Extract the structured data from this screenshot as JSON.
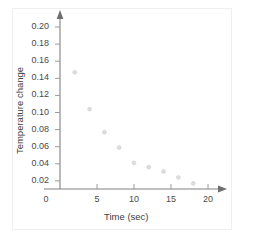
{
  "chart_data": {
    "type": "scatter",
    "title": "",
    "xlabel": "Time (sec)",
    "ylabel": "Temperature change",
    "xlim": [
      0,
      22
    ],
    "ylim": [
      0,
      0.215
    ],
    "grid": false,
    "legend": null,
    "xticks": [
      "0",
      "5",
      "10",
      "15",
      "20"
    ],
    "xtick_values": [
      0,
      5,
      10,
      15,
      20
    ],
    "yticks": [
      "0.02",
      "0.04",
      "0.06",
      "0.08",
      "0.10",
      "0.12",
      "0.14",
      "0.16",
      "0.18",
      "0.20"
    ],
    "ytick_values": [
      0.02,
      0.04,
      0.06,
      0.08,
      0.1,
      0.12,
      0.14,
      0.16,
      0.18,
      0.2
    ],
    "x": [
      2,
      4,
      6,
      8,
      10,
      12,
      14,
      16,
      18
    ],
    "values": [
      0.147,
      0.104,
      0.077,
      0.059,
      0.041,
      0.036,
      0.031,
      0.024,
      0.017
    ],
    "marker_color": "#dcdcdc",
    "axis_color": "#808080",
    "points": [
      {
        "x": 2,
        "y": 0.147
      },
      {
        "x": 4,
        "y": 0.104
      },
      {
        "x": 6,
        "y": 0.077
      },
      {
        "x": 8,
        "y": 0.059
      },
      {
        "x": 10,
        "y": 0.041
      },
      {
        "x": 12,
        "y": 0.036
      },
      {
        "x": 14,
        "y": 0.031
      },
      {
        "x": 16,
        "y": 0.024
      },
      {
        "x": 18,
        "y": 0.017
      }
    ]
  }
}
